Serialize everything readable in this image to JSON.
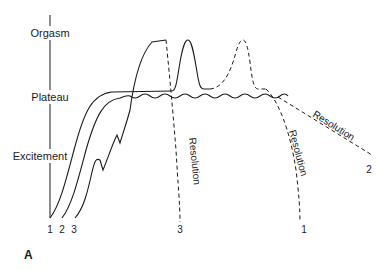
{
  "figure": {
    "panel_label": "A",
    "axis_phases": [
      "Orgasm",
      "Plateau",
      "Excitement"
    ],
    "curve_start_labels": [
      "1",
      "2",
      "3"
    ],
    "resolution_labels": {
      "curve1": "Resolution",
      "curve2": "Resolution",
      "curve3": "Resolution"
    },
    "curve_end_labels": {
      "curve1": "1",
      "curve2": "2",
      "curve3": "3"
    }
  },
  "colors": {
    "ink": "#1a1a1a",
    "background": "#ffffff"
  }
}
